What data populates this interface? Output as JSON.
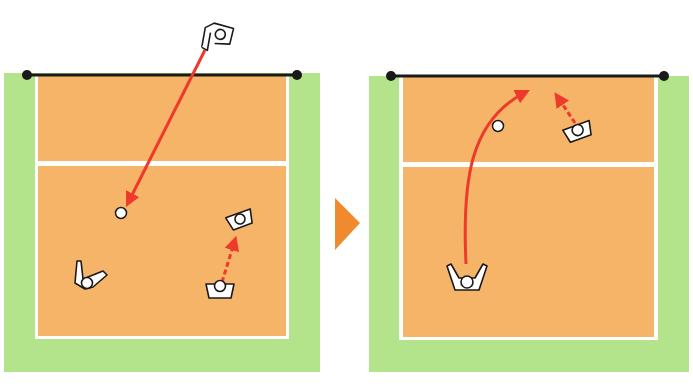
{
  "colors": {
    "background": "#ffffff",
    "free_zone": "#b3e38a",
    "court": "#f5b468",
    "court_line": "#ffffff",
    "net": "#1a1a1a",
    "arrow": "#ee3a2a",
    "step_arrow": "#f08a2e",
    "player_fill": "#ffffff",
    "player_stroke": "#1a1a1a"
  },
  "diagram": {
    "step_indicator": "right-triangle-arrow",
    "panels": [
      {
        "id": "panel-1",
        "description": "Serve received: ball travels from opponent server over net to receiver area; setter moves forward",
        "players": [
          {
            "role": "server",
            "pose": "serving",
            "x": 217,
            "y": 37
          },
          {
            "role": "passer",
            "pose": "receiving",
            "x": 93,
            "y": 282
          },
          {
            "role": "setter",
            "pose": "moving",
            "x": 220,
            "y": 290
          },
          {
            "role": "setter-destination",
            "pose": "ready",
            "x": 240,
            "y": 219
          }
        ],
        "ball": {
          "x": 121,
          "y": 213
        },
        "arrows": [
          {
            "type": "solid",
            "meaning": "ball-path",
            "from": [
              207,
              50
            ],
            "to": [
              124,
              207
            ]
          },
          {
            "type": "dashed",
            "meaning": "player-movement",
            "from": [
              222,
              282
            ],
            "to": [
              236,
              234
            ]
          }
        ]
      },
      {
        "id": "panel-2",
        "description": "Pass: receiver bumps ball in arc toward net where setter moves to set",
        "players": [
          {
            "role": "passer",
            "pose": "arms-up",
            "x": 466,
            "y": 280
          },
          {
            "role": "setter",
            "pose": "moving",
            "x": 580,
            "y": 132
          }
        ],
        "ball": {
          "x": 498,
          "y": 126
        },
        "arrows": [
          {
            "type": "solid-curved",
            "meaning": "ball-path",
            "from": [
              466,
              264
            ],
            "to": [
              530,
              90
            ]
          },
          {
            "type": "dashed",
            "meaning": "player-movement",
            "from": [
              574,
              122
            ],
            "to": [
              554,
              92
            ]
          }
        ]
      }
    ]
  }
}
